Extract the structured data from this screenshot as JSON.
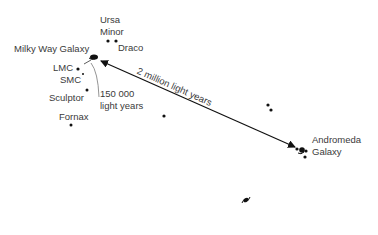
{
  "diagram": {
    "labels": {
      "ursa_minor_1": "Ursa",
      "ursa_minor_2": "Minor",
      "draco": "Draco",
      "milky_way": "Milky Way Galaxy",
      "lmc": "LMC",
      "smc": "SMC",
      "sculptor": "Sculptor",
      "fornax": "Fornax",
      "distance_mw_1": "150 000",
      "distance_mw_2": "light years",
      "distance_andromeda": "2 million light years",
      "andromeda_1": "Andromeda",
      "andromeda_2": "Galaxy"
    },
    "colors": {
      "ink": "#111111",
      "text": "#3a3a3a",
      "leader": "#888888"
    }
  }
}
